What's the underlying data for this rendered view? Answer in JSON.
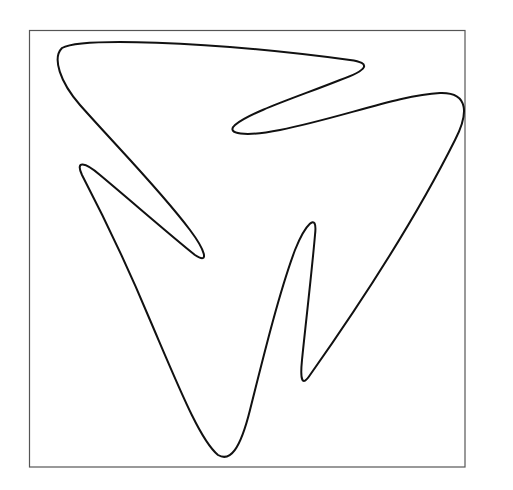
{
  "figure": {
    "frame": {
      "x": 29.5,
      "y": 31,
      "width": 206,
      "height": 436
    },
    "frame_box": {
      "x1": 29.5,
      "y1": 30.5,
      "x2": 465,
      "y2": 467
    },
    "stroke_color": "#111111",
    "frame_color": "#555555",
    "background": "#ffffff",
    "curve_path": "M 62 48 C 80 38, 200 40, 350 60 C 372 63, 368 70, 340 80 C 300 96, 250 112, 235 125 C 225 134, 245 137, 280 130 C 340 118, 400 95, 440 93 C 470 92, 468 115, 455 140 C 420 210, 370 290, 310 375 C 302 387, 300 380, 302 360 C 305 330, 312 270, 315 235 C 318 210, 305 225, 295 250 C 280 290, 265 350, 250 410 C 240 450, 230 462, 218 455 C 200 440, 180 390, 150 320 C 125 260, 95 200, 82 175 C 75 160, 85 162, 100 175 C 130 200, 170 235, 195 255 C 210 265, 205 250, 190 230 C 160 190, 120 150, 80 105 C 60 82, 52 58, 62 48 Z"
  }
}
